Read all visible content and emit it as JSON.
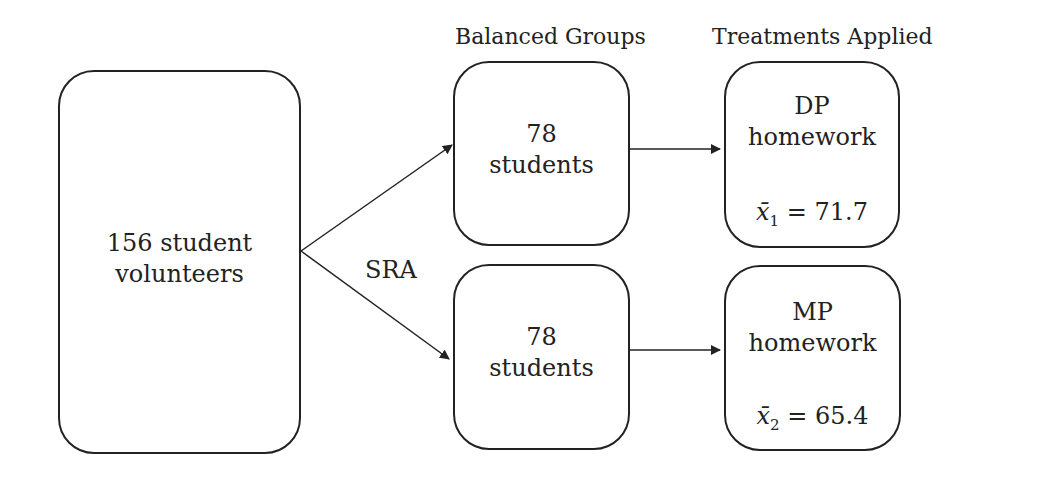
{
  "headers": {
    "groups": "Balanced Groups",
    "treatments": "Treatments Applied"
  },
  "source": {
    "line1": "156 student",
    "line2": "volunteers"
  },
  "split_label": "SRA",
  "groups": [
    {
      "line1": "78",
      "line2": "students"
    },
    {
      "line1": "78",
      "line2": "students"
    }
  ],
  "treatments": [
    {
      "line1": "DP",
      "line2": "homework",
      "mean_symbol": "x̄",
      "mean_sub": "1",
      "mean_value": "= 71.7"
    },
    {
      "line1": "MP",
      "line2": "homework",
      "mean_symbol": "x̄",
      "mean_sub": "2",
      "mean_value": "= 65.4"
    }
  ]
}
